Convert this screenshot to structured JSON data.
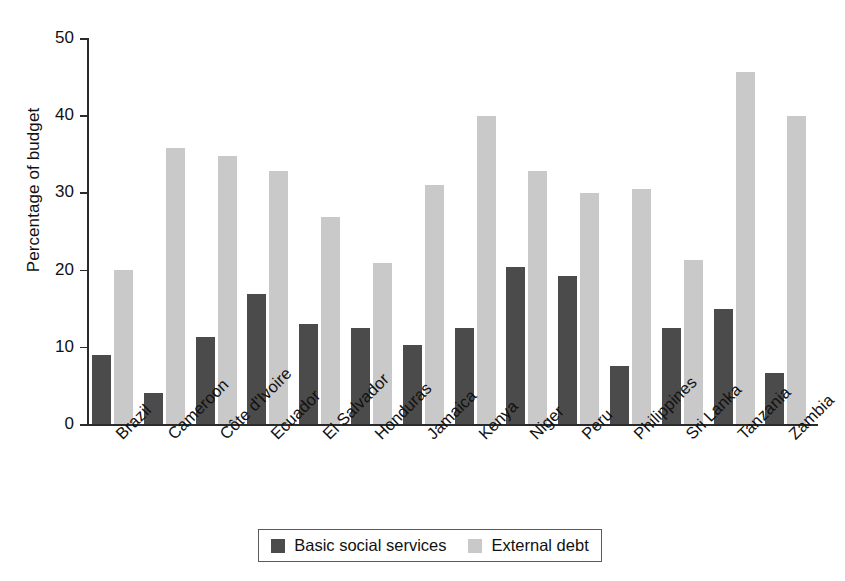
{
  "chart_data": {
    "type": "bar",
    "title": "",
    "xlabel": "",
    "ylabel": "Percentage of budget",
    "ylim": [
      0,
      50
    ],
    "yticks": [
      0,
      10,
      20,
      30,
      40,
      50
    ],
    "grid": false,
    "legend_position": "bottom",
    "categories": [
      "Brazil",
      "Cameroon",
      "Côte d'Ivoire",
      "Ecuador",
      "El Salvador",
      "Honduras",
      "Jamaica",
      "Kenya",
      "Niger",
      "Peru",
      "Philippines",
      "Sri Lanka",
      "Tanzania",
      "Zambia"
    ],
    "series": [
      {
        "name": "Basic social services",
        "color": "#4b4b4b",
        "values": [
          8.9,
          4.0,
          11.3,
          16.9,
          12.9,
          12.4,
          10.2,
          12.5,
          20.3,
          19.2,
          7.5,
          12.5,
          14.9,
          6.6
        ]
      },
      {
        "name": "External debt",
        "color": "#c9c9c9",
        "values": [
          19.9,
          35.8,
          34.7,
          32.8,
          26.8,
          20.8,
          31.0,
          39.9,
          32.8,
          29.9,
          30.4,
          21.3,
          45.6,
          39.9
        ]
      }
    ]
  },
  "axis": {
    "tick_labels": [
      "0",
      "10",
      "20",
      "30",
      "40",
      "50"
    ]
  },
  "colors": {
    "dark": "#4b4b4b",
    "light": "#c9c9c9",
    "axis": "#2b2b2b",
    "background": "#ffffff"
  }
}
